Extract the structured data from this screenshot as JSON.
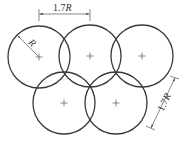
{
  "diagram": {
    "stroke_color": "#3a3a3a",
    "dim_color": "#555555",
    "radius_px": 31,
    "circles": [
      {
        "id": "circle-1",
        "cx": 39,
        "cy": 57
      },
      {
        "id": "circle-2",
        "cx": 90,
        "cy": 56
      },
      {
        "id": "circle-3",
        "cx": 142,
        "cy": 56
      },
      {
        "id": "circle-4",
        "cx": 64,
        "cy": 103
      },
      {
        "id": "circle-5",
        "cx": 116,
        "cy": 103
      }
    ],
    "labels": {
      "top_dimension_number": "1.7",
      "top_dimension_var": "R",
      "radius_label": "R",
      "side_dimension_number": "1.7",
      "side_dimension_var": "R"
    }
  }
}
